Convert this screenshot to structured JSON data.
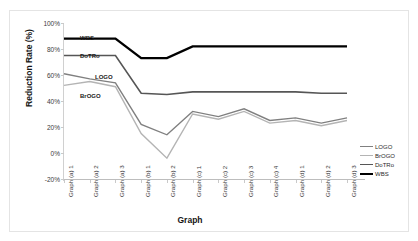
{
  "chart_data": {
    "type": "line",
    "title": "",
    "xlabel": "Graph",
    "ylabel": "Reduction Rate (%)",
    "ylim": [
      -20,
      100
    ],
    "ytick_labels": [
      "100%",
      "80%",
      "60%",
      "40%",
      "20%",
      "0%",
      "-20%"
    ],
    "ytick_values": [
      100,
      80,
      60,
      40,
      20,
      0,
      -20
    ],
    "grid": false,
    "legend_position": "right-inside-bottom",
    "categories": [
      "Graph (a) 1",
      "Graph (a) 2",
      "Graph (a) 3",
      "Graph (b) 1",
      "Graph (b) 2",
      "Graph (c) 1",
      "Graph (c) 2",
      "Graph (c) 3",
      "Graph (c) 4",
      "Graph (d) 1",
      "Graph (d) 2",
      "Graph (d) 3"
    ],
    "series": [
      {
        "name": "LOGO",
        "color": "#808080",
        "width": 1.4,
        "values": [
          61,
          57,
          54,
          22,
          14,
          32,
          28,
          34,
          25,
          27,
          23,
          27
        ]
      },
      {
        "name": "BrOGO",
        "color": "#b4b4b4",
        "width": 1.4,
        "values": [
          52,
          55,
          51,
          15,
          -4,
          30,
          26,
          32,
          23,
          25,
          21,
          25
        ]
      },
      {
        "name": "DoTRo",
        "color": "#565656",
        "width": 1.6,
        "values": [
          75,
          75,
          75,
          46,
          45,
          47,
          47,
          47,
          47,
          47,
          46,
          46
        ]
      },
      {
        "name": "WBS",
        "color": "#000000",
        "width": 2.4,
        "values": [
          88,
          88,
          88,
          73,
          73,
          82,
          82,
          82,
          82,
          82,
          82,
          82
        ]
      }
    ],
    "inline_labels": [
      {
        "text": "WBS",
        "series": "WBS"
      },
      {
        "text": "DoTRo",
        "series": "DoTRo"
      },
      {
        "text": "LOGO",
        "series": "LOGO"
      },
      {
        "text": "BrOGO",
        "series": "BrOGO"
      }
    ]
  },
  "legend": {
    "items": [
      {
        "label": "LOGO"
      },
      {
        "label": "BrOGO"
      },
      {
        "label": "DoTRo"
      },
      {
        "label": "WBS"
      }
    ]
  }
}
